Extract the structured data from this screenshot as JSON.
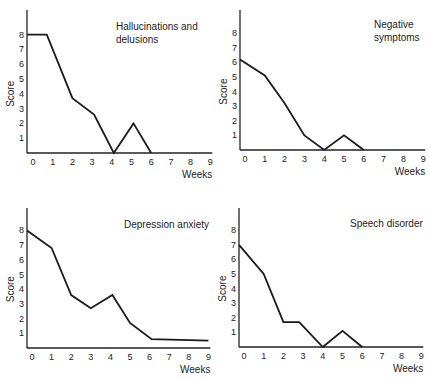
{
  "chart_data": [
    {
      "type": "line",
      "title": "Hallucinations and delusions",
      "xlabel": "Weeks",
      "ylabel": "Score",
      "x_ticks": [
        0,
        1,
        2,
        3,
        4,
        5,
        6,
        7,
        8,
        9
      ],
      "y_ticks": [
        1,
        2,
        3,
        4,
        5,
        6,
        7,
        8
      ],
      "xlim": [
        0,
        9
      ],
      "ylim": [
        0,
        9
      ],
      "grid": false,
      "x": [
        0,
        0.7,
        2,
        3.1,
        4.1,
        5.1,
        6
      ],
      "values": [
        8,
        8,
        3.7,
        2.6,
        0,
        2,
        0
      ]
    },
    {
      "type": "line",
      "title": "Negative symptoms",
      "xlabel": "Weeks",
      "ylabel": "Score",
      "x_ticks": [
        0,
        1,
        2,
        3,
        4,
        5,
        6,
        7,
        8,
        9
      ],
      "y_ticks": [
        1,
        2,
        3,
        4,
        5,
        6,
        7,
        8
      ],
      "xlim": [
        0,
        9
      ],
      "ylim": [
        0,
        9
      ],
      "grid": false,
      "x": [
        0,
        1,
        2,
        3,
        4,
        5,
        6
      ],
      "values": [
        6.2,
        5.1,
        3.2,
        1,
        0,
        1,
        0
      ]
    },
    {
      "type": "line",
      "title": "Depression anxiety",
      "xlabel": "Weeks",
      "ylabel": "Score",
      "x_ticks": [
        0,
        1,
        2,
        3,
        4,
        5,
        6,
        7,
        8,
        9
      ],
      "y_ticks": [
        1,
        2,
        3,
        4,
        5,
        6,
        7,
        8
      ],
      "xlim": [
        0,
        9
      ],
      "ylim": [
        0,
        9
      ],
      "grid": false,
      "x": [
        0,
        1,
        2,
        3,
        4.1,
        5,
        6.1,
        9
      ],
      "values": [
        8,
        6.8,
        3.6,
        2.7,
        3.6,
        1.7,
        0.6,
        0.5
      ]
    },
    {
      "type": "line",
      "title": "Speech disorder",
      "xlabel": "Weeks",
      "ylabel": "Score",
      "x_ticks": [
        0,
        1,
        2,
        3,
        4,
        5,
        6,
        7,
        8,
        9
      ],
      "y_ticks": [
        1,
        2,
        3,
        4,
        5,
        6,
        7,
        8
      ],
      "xlim": [
        0,
        9
      ],
      "ylim": [
        0,
        9
      ],
      "grid": false,
      "x": [
        0,
        1,
        2,
        2.8,
        4,
        5,
        6
      ],
      "values": [
        7,
        5,
        1.7,
        1.7,
        0,
        1.1,
        0
      ]
    }
  ],
  "panels": [
    {
      "title_lines": [
        "Hallucinations and",
        "delusions"
      ],
      "xlabel": "Weeks",
      "ylabel": "Score"
    },
    {
      "title_lines": [
        "Negative",
        "symptoms"
      ],
      "xlabel": "Weeks",
      "ylabel": "Score"
    },
    {
      "title_lines": [
        "Depression anxiety"
      ],
      "xlabel": "Weeks",
      "ylabel": "Score"
    },
    {
      "title_lines": [
        "Speech disorder"
      ],
      "xlabel": "Weeks",
      "ylabel": "Score"
    }
  ]
}
